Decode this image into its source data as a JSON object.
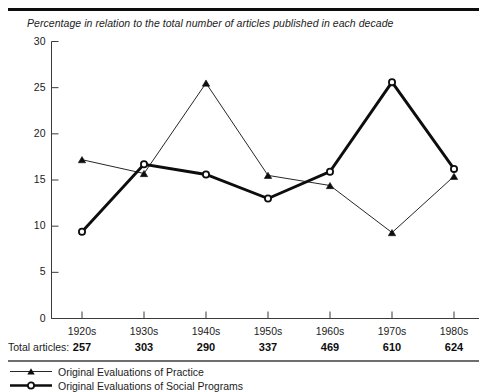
{
  "figure": {
    "subtitle": "Percentage in relation to the total number of articles published in each decade",
    "totals_label": "Total articles:"
  },
  "chart_data": {
    "type": "line",
    "title": "",
    "subtitle": "Percentage in relation to the total number of articles published in each decade",
    "xlabel": "",
    "ylabel": "",
    "categories": [
      "1920s",
      "1930s",
      "1940s",
      "1950s",
      "1960s",
      "1970s",
      "1980s"
    ],
    "ylim": [
      0,
      30
    ],
    "yticks": [
      0,
      5,
      10,
      15,
      20,
      25,
      30
    ],
    "ytick_labels": [
      "0",
      "5",
      "10",
      "15",
      "20",
      "25",
      "30"
    ],
    "grid": false,
    "legend_position": "below-axes",
    "series": [
      {
        "name": "Original Evaluations of Practice",
        "marker": "filled-triangle",
        "line_width": "thin",
        "color": "#0d0d0d",
        "values": [
          17.2,
          15.7,
          25.5,
          15.5,
          14.4,
          9.3,
          15.4
        ]
      },
      {
        "name": "Original Evaluations of Social Programs",
        "marker": "open-circle",
        "line_width": "thick",
        "color": "#0d0d0d",
        "values": [
          9.4,
          16.7,
          15.6,
          13.0,
          15.9,
          25.6,
          16.2
        ]
      }
    ],
    "annotations": {
      "totals_label": "Total articles:",
      "totals": [
        257,
        303,
        290,
        337,
        469,
        610,
        624
      ]
    }
  },
  "legend": {
    "items": [
      {
        "label": "Original Evaluations of Practice",
        "marker": "filled-triangle"
      },
      {
        "label": "Original Evaluations of Social Programs",
        "marker": "open-circle"
      }
    ]
  }
}
